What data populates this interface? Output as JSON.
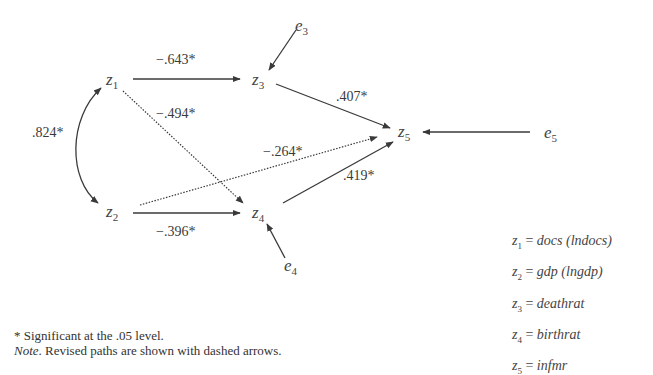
{
  "diagram": {
    "type": "path-diagram",
    "nodes": {
      "z1": {
        "base": "z",
        "sub": "1",
        "x": 113,
        "y": 84
      },
      "z2": {
        "base": "z",
        "sub": "2",
        "x": 113,
        "y": 216
      },
      "z3": {
        "base": "z",
        "sub": "3",
        "x": 254,
        "y": 83
      },
      "z4": {
        "base": "z",
        "sub": "4",
        "x": 254,
        "y": 216
      },
      "z5": {
        "base": "z",
        "sub": "5",
        "x": 398,
        "y": 136
      },
      "e3": {
        "base": "e",
        "sub": "3",
        "x": 297,
        "y": 30
      },
      "e4": {
        "base": "e",
        "sub": "4",
        "x": 286,
        "y": 272
      },
      "e5": {
        "base": "e",
        "sub": "5",
        "x": 545,
        "y": 137
      }
    },
    "paths": [
      {
        "from": "z1",
        "to": "z3",
        "coef": "−.643*",
        "style": "solid"
      },
      {
        "from": "z1",
        "to": "z4",
        "coef": "−.494*",
        "style": "dotted"
      },
      {
        "from": "z2",
        "to": "z4",
        "coef": "−.396*",
        "style": "solid"
      },
      {
        "from": "z2",
        "to": "z5",
        "coef": "−.264*",
        "style": "dotted"
      },
      {
        "from": "z3",
        "to": "z5",
        "coef": ".407*",
        "style": "solid"
      },
      {
        "from": "z4",
        "to": "z5",
        "coef": ".419*",
        "style": "solid"
      },
      {
        "from": "z1",
        "to": "z2",
        "coef": ".824*",
        "style": "curved-double-headed"
      },
      {
        "from": "e3",
        "to": "z3",
        "coef": "",
        "style": "solid"
      },
      {
        "from": "e4",
        "to": "z4",
        "coef": "",
        "style": "solid"
      },
      {
        "from": "e5",
        "to": "z5",
        "coef": "",
        "style": "solid"
      }
    ],
    "labels": {
      "z1_z3": "−.643*",
      "z1_z4": "−.494*",
      "z2_z4": "−.396*",
      "z2_z5": "−.264*",
      "z3_z5": ".407*",
      "z4_z5": ".419*",
      "z1_z2": ".824*"
    }
  },
  "legend": [
    {
      "var": "z",
      "sub": "1",
      "eq": " = ",
      "name": "docs",
      "extra": " (lndocs)"
    },
    {
      "var": "z",
      "sub": "2",
      "eq": " = ",
      "name": "gdp",
      "extra": " (lngdp)"
    },
    {
      "var": "z",
      "sub": "3",
      "eq": " = ",
      "name": "deathrat",
      "extra": ""
    },
    {
      "var": "z",
      "sub": "4",
      "eq": " = ",
      "name": "birthrat",
      "extra": ""
    },
    {
      "var": "z",
      "sub": "5",
      "eq": " = ",
      "name": "infmr",
      "extra": ""
    }
  ],
  "notes": {
    "significance": "* Significant at the .05 level.",
    "note_label": "Note",
    "note_text": ". Revised paths are shown with dashed arrows."
  }
}
